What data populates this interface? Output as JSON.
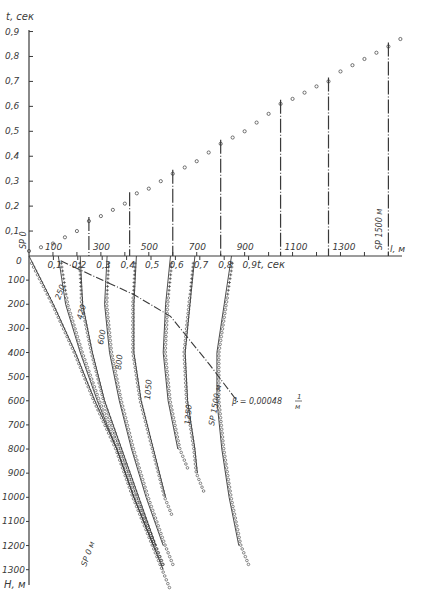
{
  "chart_data": {
    "type": "line",
    "title": "",
    "colors": {
      "ink": "#3a3a3a",
      "background": "#ffffff"
    },
    "upper_panel": {
      "description": "Travel time vs source offset (surface hodograph)",
      "ylabel": "t, сек",
      "y_ticks": [
        "0,9",
        "0,8",
        "0,7",
        "0,6",
        "0,5",
        "0,4",
        "0,3",
        "0,2",
        "0,1",
        "0"
      ],
      "ylim": [
        0,
        0.9
      ],
      "xlabel": "l, м",
      "x_ticks": [
        "100",
        "300",
        "500",
        "700",
        "900",
        "1100",
        "1300"
      ],
      "xlim": [
        0,
        1500
      ],
      "origin_label": "SP 0",
      "end_label": "SP 1500 м",
      "series": [
        {
          "name": "first-arrival times",
          "marker": "circle",
          "x": [
            0,
            100,
            200,
            250,
            300,
            400,
            420,
            500,
            600,
            700,
            800,
            900,
            1000,
            1050,
            1100,
            1200,
            1250,
            1300,
            1400,
            1500,
            1550
          ],
          "y": [
            0.02,
            0.05,
            0.1,
            0.14,
            0.16,
            0.21,
            0.24,
            0.27,
            0.33,
            0.38,
            0.45,
            0.5,
            0.57,
            0.61,
            0.63,
            0.68,
            0.7,
            0.74,
            0.79,
            0.84,
            0.87
          ]
        }
      ],
      "vertical_markers_x_m": [
        250,
        420,
        600,
        800,
        1050,
        1250,
        1500
      ]
    },
    "lower_panel": {
      "description": "Vertical seismic profiling traveltime curves vs depth",
      "xlabel": "t, сек",
      "x_ticks": [
        "0,1",
        "0,2",
        "0,3",
        "0,4",
        "0,5",
        "0,6",
        "0,7",
        "0,8",
        "0,9"
      ],
      "xlim": [
        0,
        1.0
      ],
      "ylabel": "H, м",
      "y_ticks": [
        "0",
        "100",
        "200",
        "300",
        "400",
        "500",
        "600",
        "700",
        "800",
        "900",
        "1000",
        "1100",
        "1200",
        "1300"
      ],
      "ylim": [
        0,
        1350
      ],
      "curve_labels": [
        "SP 0 м",
        "250",
        "420",
        "600",
        "800",
        "1050",
        "1250",
        "SP 1500 м"
      ],
      "series": [
        {
          "name": "SP 0 м",
          "depth": [
            0,
            200,
            400,
            600,
            800,
            1000,
            1200,
            1300
          ],
          "time": [
            0.0,
            0.1,
            0.19,
            0.27,
            0.36,
            0.43,
            0.51,
            0.55
          ]
        },
        {
          "name": "250",
          "depth": [
            0,
            200,
            400,
            600,
            800,
            1000,
            1200
          ],
          "time": [
            0.12,
            0.15,
            0.21,
            0.28,
            0.36,
            0.43,
            0.51
          ]
        },
        {
          "name": "420",
          "depth": [
            0,
            200,
            400,
            600,
            800,
            1000,
            1200
          ],
          "time": [
            0.21,
            0.22,
            0.26,
            0.31,
            0.38,
            0.45,
            0.52
          ]
        },
        {
          "name": "600",
          "depth": [
            0,
            200,
            400,
            600,
            800,
            1000,
            1200
          ],
          "time": [
            0.32,
            0.31,
            0.33,
            0.37,
            0.42,
            0.48,
            0.55
          ]
        },
        {
          "name": "800",
          "depth": [
            0,
            200,
            400,
            600,
            800,
            1000
          ],
          "time": [
            0.44,
            0.43,
            0.43,
            0.46,
            0.51,
            0.56
          ]
        },
        {
          "name": "1050",
          "depth": [
            0,
            200,
            400,
            600,
            800
          ],
          "time": [
            0.58,
            0.56,
            0.55,
            0.57,
            0.61
          ]
        },
        {
          "name": "1250",
          "depth": [
            0,
            200,
            400,
            600,
            800,
            900
          ],
          "time": [
            0.68,
            0.66,
            0.64,
            0.65,
            0.68,
            0.69
          ]
        },
        {
          "name": "SP 1500 м",
          "depth": [
            0,
            200,
            400,
            600,
            800,
            1000,
            1200
          ],
          "time": [
            0.83,
            0.8,
            0.77,
            0.77,
            0.79,
            0.82,
            0.86
          ]
        }
      ],
      "annotation": {
        "text": "β = 0,00048 1/м",
        "curve": "dash-dot boundary crossing curves",
        "points_time_depth": [
          [
            0.13,
            20
          ],
          [
            0.3,
            100
          ],
          [
            0.43,
            160
          ],
          [
            0.58,
            250
          ],
          [
            0.66,
            350
          ],
          [
            0.74,
            450
          ],
          [
            0.86,
            610
          ]
        ]
      }
    }
  },
  "labels": {
    "t_axis_title": "t, сек",
    "h_axis_title": "H, м",
    "l_axis_title": "l, м",
    "t_axis_bottom_title": "t, сек",
    "sp0": "SP 0",
    "sp1500_top": "SP 1500 м",
    "sp0m_curve": "SP 0 м",
    "sp1500_curve": "SP 1500 м",
    "beta": "β = 0,00048",
    "beta_num": "1",
    "beta_den": "м",
    "zero": "0"
  }
}
